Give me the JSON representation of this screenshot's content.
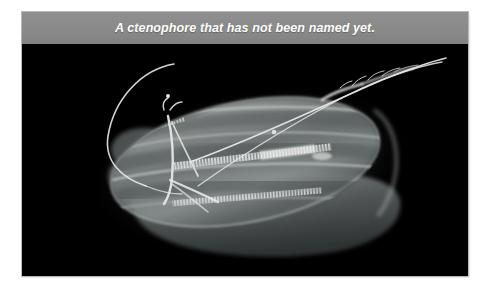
{
  "page": {
    "background_color": "#ffffff",
    "width": 494,
    "height": 296
  },
  "figure": {
    "panel_border_color": "#b9b9b9",
    "caption": {
      "text": "A ctenophore that has not been named yet.",
      "text_color": "#ffffff",
      "background_color": "#8a8a8a",
      "style": "italic-bold"
    },
    "photo": {
      "background_color": "#000000",
      "subject": "ctenophore",
      "subject_description": "translucent grayscale comb jelly with lobed body, longitudinal comb rows and branching tentacles on a black background",
      "alt_text": "A ctenophore that has not been named yet.",
      "body_color_light": "#b9bdbd",
      "body_color_mid": "#6e7474",
      "body_color_dark": "#303636",
      "tentacle_color": "#e8eae8",
      "comb_row_color": "#f2f4f2"
    }
  }
}
